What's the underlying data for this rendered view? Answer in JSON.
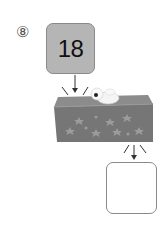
{
  "problem": {
    "number_label": "⑧",
    "input_value": "18",
    "output_value": ""
  },
  "colors": {
    "input_box_fill": "#b5b5b5",
    "machine_front": "#767676",
    "machine_top": "#8c8c8c",
    "stars": "#9c9c9c",
    "border": "#8a8a8a"
  },
  "icons": {
    "machine": "magic-box-icon",
    "creature": "ghost-creature-icon",
    "arrow": "arrow-down-icon"
  }
}
